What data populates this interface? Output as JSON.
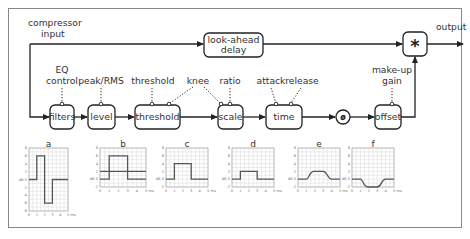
{
  "diagram": {
    "input_label_line1": "compressor",
    "input_label_line2": "input",
    "output_label": "output",
    "delay_line1": "look-ahead",
    "delay_line2": "delay",
    "multiplier_symbol": "*",
    "blocks": [
      {
        "id": "filters",
        "label": "filters",
        "control_line1": "EQ",
        "control_line2": "control"
      },
      {
        "id": "level",
        "label": "level",
        "control_line1": "peak/RMS"
      },
      {
        "id": "threshold",
        "label": "threshold",
        "control_line1": "threshold"
      },
      {
        "id": "scale",
        "label": "scale",
        "control_line1": "ratio"
      },
      {
        "id": "time",
        "label": "time",
        "control_line1": "attack",
        "control_line2": "release"
      },
      {
        "id": "db-to-linear",
        "label": "ø"
      },
      {
        "id": "offset",
        "label": "offset",
        "control_line1": "make-up",
        "control_line2": "gain"
      }
    ],
    "shared_control": "knee"
  },
  "chart_data": [
    {
      "type": "line",
      "title": "a",
      "ylabel": "dB",
      "xlabel": "ms",
      "ylim": [
        -8,
        8
      ],
      "yticks": [
        8,
        6,
        4,
        2,
        0,
        -2,
        -4,
        -6,
        -8
      ],
      "xticks": [
        "0",
        "1",
        "2",
        "3",
        "4",
        "5 ms"
      ],
      "x": [
        0,
        1,
        1,
        2,
        2,
        3,
        3,
        5
      ],
      "values": [
        0,
        0,
        6,
        6,
        -6,
        -6,
        0,
        0
      ]
    },
    {
      "type": "line",
      "title": "b",
      "ylabel": "dB",
      "xlabel": "ms",
      "ylim": [
        -2,
        8
      ],
      "yticks": [
        8,
        6,
        4,
        2,
        0,
        -2
      ],
      "xticks": [
        "0",
        "1",
        "2",
        "3",
        "4",
        "5 ms"
      ],
      "series": [
        {
          "name": "signal",
          "x": [
            0,
            1,
            1,
            3,
            3,
            5
          ],
          "values": [
            0,
            0,
            6,
            6,
            0,
            0
          ]
        },
        {
          "name": "threshold",
          "x": [
            0,
            5
          ],
          "values": [
            2,
            2
          ]
        }
      ]
    },
    {
      "type": "line",
      "title": "c",
      "ylabel": "dB",
      "xlabel": "ms",
      "ylim": [
        -2,
        8
      ],
      "yticks": [
        8,
        6,
        4,
        2,
        0,
        -2
      ],
      "xticks": [
        "0",
        "1",
        "2",
        "3",
        "4",
        "5 ms"
      ],
      "x": [
        0,
        1,
        1,
        3,
        3,
        5
      ],
      "values": [
        0,
        0,
        4,
        4,
        0,
        0
      ]
    },
    {
      "type": "line",
      "title": "d",
      "ylabel": "dB",
      "xlabel": "ms",
      "ylim": [
        -2,
        8
      ],
      "yticks": [
        8,
        6,
        4,
        2,
        0,
        -2
      ],
      "xticks": [
        "0",
        "1",
        "2",
        "3",
        "4",
        "5 ms"
      ],
      "x": [
        0,
        1,
        1,
        3,
        3,
        5
      ],
      "values": [
        0,
        0,
        2,
        2,
        0,
        0
      ]
    },
    {
      "type": "line",
      "title": "e",
      "ylabel": "dB",
      "xlabel": "ms",
      "ylim": [
        -2,
        8
      ],
      "yticks": [
        8,
        6,
        4,
        2,
        0,
        -2
      ],
      "xticks": [
        "0",
        "1",
        "2",
        "3",
        "4",
        "5 ms"
      ],
      "x": [
        0,
        1,
        1.5,
        2,
        3,
        3.5,
        4,
        5
      ],
      "values": [
        0,
        0,
        1.6,
        2,
        2,
        0.6,
        0,
        0
      ]
    },
    {
      "type": "line",
      "title": "f",
      "ylabel": "dB",
      "xlabel": "ms",
      "ylim": [
        -2,
        8
      ],
      "yticks": [
        8,
        6,
        4,
        2,
        0,
        -2
      ],
      "xticks": [
        "0",
        "1",
        "2",
        "3",
        "4",
        "5 ms"
      ],
      "x": [
        0,
        1,
        1.5,
        2,
        3,
        3.5,
        4,
        5
      ],
      "values": [
        0,
        0,
        -1.6,
        -2,
        -2,
        -0.6,
        0,
        0
      ]
    }
  ]
}
